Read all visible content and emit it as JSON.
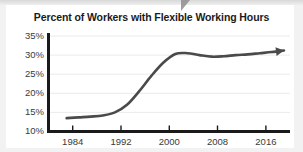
{
  "chart_data": {
    "type": "line",
    "title": "Percent of Workers with Flexible Working Hours",
    "xlabel": "",
    "ylabel": "",
    "xlim": [
      1980,
      2020
    ],
    "ylim": [
      10,
      35
    ],
    "grid": true,
    "legend": "none",
    "x_ticks": [
      "1984",
      "1992",
      "2000",
      "2008",
      "2016"
    ],
    "x_tick_values": [
      1984,
      1992,
      2000,
      2008,
      2016
    ],
    "y_ticks": [
      "10%",
      "15%",
      "20%",
      "25%",
      "30%",
      "35%"
    ],
    "y_tick_values": [
      10,
      15,
      20,
      25,
      30,
      35
    ],
    "series": [
      {
        "name": "Percent of workers with flexible working hours",
        "x": [
          1983,
          1985,
          1987,
          1989,
          1991,
          1993,
          1995,
          1997,
          1999,
          2001,
          2003,
          2005,
          2007,
          2009,
          2011,
          2013,
          2015,
          2017,
          2019
        ],
        "values": [
          13.5,
          13.7,
          13.9,
          14.2,
          15.0,
          17.0,
          20.5,
          24.5,
          28.0,
          30.3,
          30.5,
          30.0,
          29.6,
          29.7,
          30.0,
          30.2,
          30.5,
          30.8,
          31.2
        ],
        "arrow_end": true
      }
    ],
    "annotations": [],
    "line_color": "#4a4a4a",
    "axis_color": "#1a1a1a",
    "grid_color": "#eceaea",
    "background": "#ffffff"
  },
  "figure": {
    "title": "Percent of Workers with Flexible Working Hours",
    "cursor_artifact": "pointer-artifact"
  }
}
